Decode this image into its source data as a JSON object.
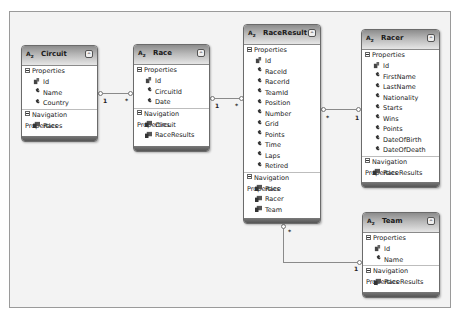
{
  "diagram": {
    "entities": {
      "circuit": {
        "title": "Circuit",
        "properties_label": "Properties",
        "properties": [
          {
            "name": "Id",
            "key": true
          },
          {
            "name": "Name",
            "key": false
          },
          {
            "name": "Country",
            "key": false
          }
        ],
        "navigation_label": "Navigation Properties",
        "navigation": [
          "Races"
        ]
      },
      "race": {
        "title": "Race",
        "properties_label": "Properties",
        "properties": [
          {
            "name": "Id",
            "key": true
          },
          {
            "name": "CircuitId",
            "key": false
          },
          {
            "name": "Date",
            "key": false
          }
        ],
        "navigation_label": "Navigation Properties",
        "navigation": [
          "Circuit",
          "RaceResults"
        ]
      },
      "raceresult": {
        "title": "RaceResult",
        "properties_label": "Properties",
        "properties": [
          {
            "name": "Id",
            "key": true
          },
          {
            "name": "RaceId",
            "key": false
          },
          {
            "name": "RacerId",
            "key": false
          },
          {
            "name": "TeamId",
            "key": false
          },
          {
            "name": "Position",
            "key": false
          },
          {
            "name": "Number",
            "key": false
          },
          {
            "name": "Grid",
            "key": false
          },
          {
            "name": "Points",
            "key": false
          },
          {
            "name": "Time",
            "key": false
          },
          {
            "name": "Laps",
            "key": false
          },
          {
            "name": "Retired",
            "key": false
          }
        ],
        "navigation_label": "Navigation Properties",
        "navigation": [
          "Race",
          "Racer",
          "Team"
        ]
      },
      "racer": {
        "title": "Racer",
        "properties_label": "Properties",
        "properties": [
          {
            "name": "Id",
            "key": true
          },
          {
            "name": "FirstName",
            "key": false
          },
          {
            "name": "LastName",
            "key": false
          },
          {
            "name": "Nationality",
            "key": false
          },
          {
            "name": "Starts",
            "key": false
          },
          {
            "name": "Wins",
            "key": false
          },
          {
            "name": "Points",
            "key": false
          },
          {
            "name": "DateOfBirth",
            "key": false
          },
          {
            "name": "DateOfDeath",
            "key": false
          }
        ],
        "navigation_label": "Navigation Properties",
        "navigation": [
          "RaceResults"
        ]
      },
      "team": {
        "title": "Team",
        "properties_label": "Properties",
        "properties": [
          {
            "name": "Id",
            "key": true
          },
          {
            "name": "Name",
            "key": false
          }
        ],
        "navigation_label": "Navigation Properties",
        "navigation": [
          "RaceResults"
        ]
      }
    },
    "associations": [
      {
        "from": "Circuit",
        "to": "Race",
        "from_mult": "1",
        "to_mult": "*"
      },
      {
        "from": "Race",
        "to": "RaceResult",
        "from_mult": "1",
        "to_mult": "*"
      },
      {
        "from": "RaceResult",
        "to": "Racer",
        "from_mult": "*",
        "to_mult": "1"
      },
      {
        "from": "RaceResult",
        "to": "Team",
        "from_mult": "*",
        "to_mult": "1"
      }
    ],
    "icons": {
      "entity": "entity-type-icon",
      "collapse": "collapse-chevron-icon",
      "key_property": "key-property-icon",
      "property": "wrench-property-icon",
      "navigation": "navigation-property-icon",
      "section_toggle": "minus-box-icon"
    },
    "colors": {
      "header_dark": "#8c8c8c",
      "header_light": "#e6e6e6",
      "footer": "#555555",
      "canvas": "#f3f3f3",
      "connector": "#8a8a8a"
    }
  }
}
